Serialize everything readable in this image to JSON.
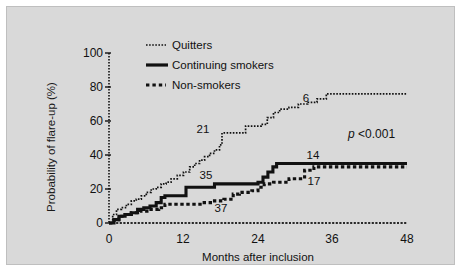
{
  "figure": {
    "background_color": "#d9d9d9",
    "page_color": "#ffffff",
    "ink_color": "#111111"
  },
  "axis": {
    "ylabel": "Probability of flare-up (%)",
    "xlabel": "Months after inclusion",
    "yticks": [
      "0",
      "20",
      "40",
      "60",
      "80",
      "100"
    ],
    "xticks": [
      "0",
      "12",
      "24",
      "36",
      "48"
    ]
  },
  "legend": {
    "items": [
      {
        "label": "Quitters",
        "style": "fine-dotted"
      },
      {
        "label": "Continuing smokers",
        "style": "thick-solid"
      },
      {
        "label": "Non-smokers",
        "style": "coarse-dotted"
      }
    ]
  },
  "annotations": {
    "quitters_mid": "21",
    "quitters_end": "6",
    "smokers_mid": "35",
    "smokers_end": "14",
    "nonsmokers_mid": "37",
    "nonsmokers_end": "17",
    "pvalue_symbol": "p",
    "pvalue_value": " <0.001"
  },
  "chart_data": {
    "type": "line",
    "title": "",
    "subtitle": "",
    "xlabel": "Months after inclusion",
    "ylabel": "Probability of flare-up (%)",
    "xlim": [
      0,
      48
    ],
    "ylim": [
      0,
      100
    ],
    "xticks": [
      0,
      12,
      24,
      36,
      48
    ],
    "yticks": [
      0,
      20,
      40,
      60,
      80,
      100
    ],
    "grid": false,
    "legend_position": "top-left",
    "annotations": [
      {
        "text": "21",
        "x": 18,
        "y": 53,
        "series": "Quitters"
      },
      {
        "text": "6",
        "x": 35,
        "y": 76,
        "series": "Quitters"
      },
      {
        "text": "35",
        "x": 17,
        "y": 24,
        "series": "Continuing smokers"
      },
      {
        "text": "14",
        "x": 36,
        "y": 35,
        "series": "Continuing smokers"
      },
      {
        "text": "37",
        "x": 20,
        "y": 6,
        "series": "Non-smokers"
      },
      {
        "text": "17",
        "x": 37,
        "y": 26,
        "series": "Non-smokers"
      },
      {
        "text": "p <0.001",
        "x": 42,
        "y": 52,
        "series": ""
      }
    ],
    "series": [
      {
        "name": "Quitters",
        "style": "fine-dotted",
        "x": [
          0,
          0.6,
          1.2,
          2.0,
          2.8,
          3.6,
          4.4,
          5.2,
          6.0,
          6.8,
          7.6,
          8.4,
          9.2,
          10.0,
          11.0,
          12.0,
          13.0,
          13.8,
          14.6,
          15.4,
          16.2,
          17.0,
          17.8,
          18.2,
          20.5,
          22.0,
          23.5,
          24.5,
          25.5,
          26.5,
          27.5,
          29.0,
          30.5,
          32.0,
          33.5,
          35.0,
          36.0,
          40.0,
          44.0,
          48.0
        ],
        "y": [
          0,
          5,
          8,
          9,
          11,
          13,
          14,
          16,
          18,
          20,
          21,
          23,
          24,
          26,
          28,
          30,
          33,
          35,
          37,
          39,
          41,
          43,
          46,
          53,
          53,
          57,
          57,
          58,
          62,
          65,
          67,
          68,
          70,
          71,
          73,
          76,
          76,
          76,
          76,
          76
        ]
      },
      {
        "name": "Continuing smokers",
        "style": "thick-solid",
        "x": [
          0,
          0.8,
          1.6,
          2.6,
          3.6,
          4.6,
          5.6,
          6.6,
          7.6,
          8.4,
          9.0,
          12.0,
          12.4,
          16.0,
          17.0,
          20.0,
          24.0,
          24.8,
          25.6,
          26.4,
          27.0,
          31.0,
          36.0,
          40.0,
          44.0,
          48.0
        ],
        "y": [
          0,
          2,
          4,
          5,
          6,
          8,
          9,
          10,
          12,
          15,
          16,
          16,
          21,
          21,
          23,
          23,
          24,
          27,
          30,
          33,
          35,
          35,
          35,
          35,
          35,
          35
        ]
      },
      {
        "name": "Non-smokers",
        "style": "coarse-dotted",
        "x": [
          0,
          0.8,
          1.6,
          2.6,
          3.6,
          5.0,
          6.5,
          8.0,
          9.0,
          11.0,
          13.0,
          15.0,
          17.0,
          18.5,
          20.0,
          21.0,
          22.0,
          23.0,
          24.0,
          25.0,
          26.5,
          28.0,
          29.0,
          30.5,
          31.5,
          33.0,
          36.0,
          40.0,
          44.0,
          48.0
        ],
        "y": [
          0,
          2,
          4,
          5,
          6,
          7,
          8,
          9,
          11,
          11,
          11,
          12,
          13,
          14,
          17,
          18,
          18,
          19,
          21,
          23,
          24,
          24,
          26,
          26,
          31,
          33,
          33,
          33,
          33,
          33
        ]
      },
      {
        "name": "Baseline",
        "style": "thin-dotted",
        "x": [
          0,
          48
        ],
        "y": [
          0,
          0
        ]
      }
    ]
  }
}
